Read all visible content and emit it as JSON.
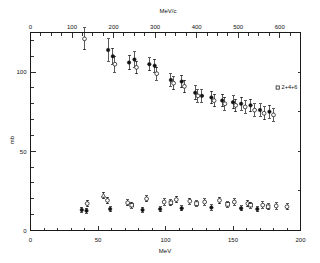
{
  "figure": {
    "background_color": "#ffffff",
    "foreground_color": "#111111"
  },
  "chart_data": {
    "type": "scatter",
    "title": "",
    "subtitle": "",
    "xlabel": "MeV",
    "ylabel": "mb",
    "top_axis_label": "MeV/c",
    "xlim": [
      0,
      200
    ],
    "ylim": [
      0,
      125
    ],
    "top_xlim": [
      0,
      650
    ],
    "grid": false,
    "legend_position": "upper-right",
    "xticks": [
      0,
      50,
      100,
      150,
      200
    ],
    "xticklabels": [
      "0",
      "50",
      "100",
      "150",
      "200"
    ],
    "yticks": [
      0,
      50,
      100
    ],
    "yticklabels": [
      "0",
      "50",
      "100"
    ],
    "top_xticks": [
      0,
      100,
      200,
      300,
      400,
      500,
      600
    ],
    "top_xticklabels": [
      "0",
      "100",
      "200",
      "300",
      "400",
      "500",
      "600"
    ],
    "x_minor_tick_step": 10,
    "y_minor_tick_step": 10,
    "top_minor_tick_step": 25,
    "annotations": [
      {
        "text": "2+4+6",
        "x": 186,
        "y": 90
      }
    ],
    "series": [
      {
        "name": "total-cross-section-filled",
        "marker": "filled-circle",
        "points": [
          {
            "x": 57.5,
            "y": 114.0,
            "yerr": 7.0
          },
          {
            "x": 61.0,
            "y": 110.0,
            "yerr": 5.0
          },
          {
            "x": 73.0,
            "y": 106.0,
            "yerr": 4.5
          },
          {
            "x": 77.0,
            "y": 108.0,
            "yerr": 5.0
          },
          {
            "x": 88.0,
            "y": 105.0,
            "yerr": 4.0
          },
          {
            "x": 92.0,
            "y": 104.0,
            "yerr": 4.0
          },
          {
            "x": 104.0,
            "y": 95.0,
            "yerr": 4.0
          },
          {
            "x": 112.0,
            "y": 94.0,
            "yerr": 4.0
          },
          {
            "x": 122.0,
            "y": 87.0,
            "yerr": 4.5
          },
          {
            "x": 127.0,
            "y": 85.0,
            "yerr": 4.0
          },
          {
            "x": 134.0,
            "y": 84.0,
            "yerr": 4.0
          },
          {
            "x": 142.0,
            "y": 82.0,
            "yerr": 4.0
          },
          {
            "x": 150.0,
            "y": 81.0,
            "yerr": 4.0
          },
          {
            "x": 156.0,
            "y": 80.0,
            "yerr": 4.0
          },
          {
            "x": 163.0,
            "y": 79.0,
            "yerr": 4.0
          },
          {
            "x": 170.0,
            "y": 76.0,
            "yerr": 4.0
          },
          {
            "x": 177.0,
            "y": 75.0,
            "yerr": 4.0
          }
        ]
      },
      {
        "name": "total-cross-section-open",
        "marker": "open-circle",
        "points": [
          {
            "x": 40.0,
            "y": 121.0,
            "yerr": 7.0
          },
          {
            "x": 62.5,
            "y": 105.0,
            "yerr": 5.0
          },
          {
            "x": 78.5,
            "y": 103.0,
            "yerr": 4.0
          },
          {
            "x": 93.5,
            "y": 99.0,
            "yerr": 4.0
          },
          {
            "x": 106.0,
            "y": 93.0,
            "yerr": 4.0
          },
          {
            "x": 114.0,
            "y": 91.0,
            "yerr": 4.0
          },
          {
            "x": 124.0,
            "y": 85.0,
            "yerr": 4.0
          },
          {
            "x": 136.0,
            "y": 82.0,
            "yerr": 4.0
          },
          {
            "x": 144.0,
            "y": 80.0,
            "yerr": 4.0
          },
          {
            "x": 152.0,
            "y": 79.0,
            "yerr": 4.0
          },
          {
            "x": 159.0,
            "y": 78.0,
            "yerr": 4.0
          },
          {
            "x": 166.0,
            "y": 76.0,
            "yerr": 4.0
          },
          {
            "x": 173.0,
            "y": 74.0,
            "yerr": 4.0
          },
          {
            "x": 180.0,
            "y": 73.0,
            "yerr": 4.0
          }
        ]
      },
      {
        "name": "partial-cross-section-open-circle",
        "marker": "open-circle",
        "points": [
          {
            "x": 42.0,
            "y": 17.0,
            "yerr": 2.0
          },
          {
            "x": 57.0,
            "y": 19.0,
            "yerr": 2.0
          },
          {
            "x": 72.0,
            "y": 17.5,
            "yerr": 2.0
          },
          {
            "x": 86.0,
            "y": 20.0,
            "yerr": 2.0
          },
          {
            "x": 99.0,
            "y": 18.0,
            "yerr": 2.0
          },
          {
            "x": 108.0,
            "y": 19.5,
            "yerr": 2.0
          },
          {
            "x": 118.0,
            "y": 18.5,
            "yerr": 2.0
          },
          {
            "x": 129.0,
            "y": 18.0,
            "yerr": 2.0
          },
          {
            "x": 140.0,
            "y": 19.0,
            "yerr": 2.0
          },
          {
            "x": 151.0,
            "y": 18.0,
            "yerr": 2.0
          },
          {
            "x": 161.0,
            "y": 17.0,
            "yerr": 2.0
          },
          {
            "x": 172.0,
            "y": 16.0,
            "yerr": 2.0
          },
          {
            "x": 182.0,
            "y": 15.5,
            "yerr": 2.0
          },
          {
            "x": 190.0,
            "y": 15.0,
            "yerr": 2.0
          }
        ]
      },
      {
        "name": "partial-cross-section-filled-circle",
        "marker": "filled-circle",
        "points": [
          {
            "x": 38.0,
            "y": 13.0,
            "yerr": 1.6
          },
          {
            "x": 41.5,
            "y": 12.5,
            "yerr": 1.6
          },
          {
            "x": 59.0,
            "y": 13.5,
            "yerr": 1.6
          },
          {
            "x": 83.0,
            "y": 13.0,
            "yerr": 1.6
          },
          {
            "x": 96.0,
            "y": 13.5,
            "yerr": 1.6
          },
          {
            "x": 112.0,
            "y": 14.0,
            "yerr": 1.6
          },
          {
            "x": 134.0,
            "y": 14.5,
            "yerr": 1.6
          },
          {
            "x": 156.0,
            "y": 14.0,
            "yerr": 1.6
          },
          {
            "x": 168.0,
            "y": 13.5,
            "yerr": 1.6
          }
        ]
      },
      {
        "name": "partial-cross-section-open-square",
        "marker": "open-square",
        "points": [
          {
            "x": 75.0,
            "y": 16.0,
            "yerr": 1.8
          },
          {
            "x": 104.0,
            "y": 17.5,
            "yerr": 1.8
          },
          {
            "x": 123.0,
            "y": 17.0,
            "yerr": 1.8
          },
          {
            "x": 146.0,
            "y": 16.5,
            "yerr": 1.8
          },
          {
            "x": 163.0,
            "y": 16.0,
            "yerr": 1.8
          },
          {
            "x": 176.0,
            "y": 15.0,
            "yerr": 1.8
          }
        ]
      },
      {
        "name": "partial-cross-section-open-triangle",
        "marker": "open-triangle",
        "points": [
          {
            "x": 54.0,
            "y": 22.0,
            "yerr": 2.0
          }
        ]
      }
    ]
  }
}
